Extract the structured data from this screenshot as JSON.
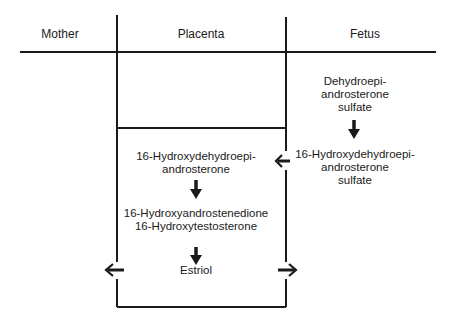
{
  "diagram": {
    "compartments": [
      {
        "id": "mother",
        "label": "Mother"
      },
      {
        "id": "placenta",
        "label": "Placenta"
      },
      {
        "id": "fetus",
        "label": "Fetus"
      }
    ],
    "nodes": {
      "fetus_dheas": {
        "line1": "Dehydroepi-",
        "line2": "androsterone",
        "line3": "sulfate"
      },
      "fetus_16oh_dheas": {
        "line1": "16-Hydroxydehydroepi-",
        "line2": "androsterone",
        "line3": "sulfate"
      },
      "placenta_16oh_dhea": {
        "line1": "16-Hydroxydehydroepi-",
        "line2": "androsterone"
      },
      "placenta_intermediates": {
        "line1": "16-Hydroxyandrostenedione",
        "line2": "16-Hydroxytestosterone"
      },
      "placenta_estriol": {
        "label": "Estriol"
      }
    },
    "edges": [
      {
        "from": "fetus_dheas",
        "to": "fetus_16oh_dheas",
        "direction": "down",
        "icon": "arrow-down-icon"
      },
      {
        "from": "fetus_16oh_dheas",
        "to": "placenta_16oh_dhea",
        "direction": "left",
        "icon": "arrow-left-icon"
      },
      {
        "from": "placenta_16oh_dhea",
        "to": "placenta_intermediates",
        "direction": "down",
        "icon": "arrow-down-icon"
      },
      {
        "from": "placenta_intermediates",
        "to": "placenta_estriol",
        "direction": "down",
        "icon": "arrow-down-icon"
      },
      {
        "from": "placenta_estriol",
        "to": "mother",
        "direction": "left",
        "icon": "arrow-left-icon"
      },
      {
        "from": "placenta_estriol",
        "to": "fetus",
        "direction": "right",
        "icon": "arrow-right-icon"
      }
    ],
    "colors": {
      "line": "#1a1a1a",
      "text": "#1a1a1a",
      "background": "#ffffff"
    }
  }
}
